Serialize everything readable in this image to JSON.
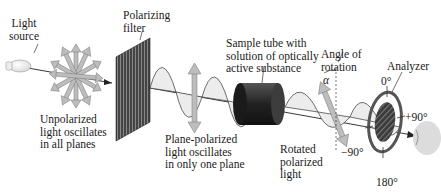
{
  "diagram": {
    "components": {
      "light_source": {
        "lines": [
          "Light",
          "source"
        ]
      },
      "polarizing_filter": {
        "lines": [
          "Polarizing",
          "filter"
        ]
      },
      "sample_tube": {
        "lines": [
          "Sample tube with",
          "solution of optically",
          "active substance"
        ]
      },
      "angle_of_rotation": {
        "lines": [
          "Angle of",
          "rotation"
        ],
        "symbol": "α"
      },
      "analyzer": {
        "lines": [
          "Analyzer"
        ],
        "scale": {
          "top": "0°",
          "right": "+90°",
          "left": "−90°",
          "bottom": "180°"
        }
      }
    },
    "captions": {
      "unpolarized": [
        "Unpolarized",
        "light oscillates",
        "in all planes"
      ],
      "plane_polarized": [
        "Plane-polarized",
        "light oscillates",
        "in only one plane"
      ],
      "rotated": [
        "Rotated",
        "polarized",
        "light"
      ]
    },
    "colors": {
      "arrow_fill": "#b8b8b8",
      "filter_dark": "#3a3a3a",
      "tube_dark": "#2b2b2b",
      "wave_fill": "#e6e6e6",
      "analyzer_ring": "#555555",
      "eye_fill": "#d9d9d9"
    }
  }
}
